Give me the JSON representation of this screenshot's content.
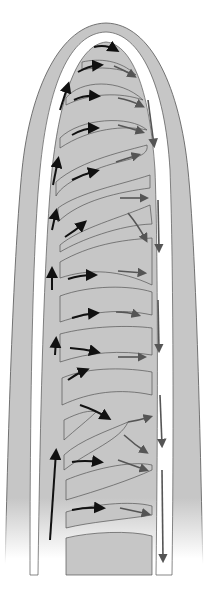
{
  "diagram": {
    "title": "",
    "colors": {
      "background": "#ffffff",
      "tissue": "#c6c6c6",
      "tissue_outline": "#555555",
      "vessel": "#ffffff",
      "arrow_arterial": "#111111",
      "arrow_venous": "#555555"
    },
    "labels": [],
    "flow": {
      "ascending_left": "arteriole (upward flow)",
      "descending_right": "venule (downward flow)",
      "cross_branches": "capillaries (left-to-right flow)"
    }
  }
}
